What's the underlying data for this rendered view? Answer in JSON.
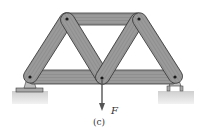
{
  "figure": {
    "force_label": "F",
    "caption": "(c)"
  },
  "colors": {
    "member_fill": "#8f8f8f",
    "member_stroke": "#3a3a3a",
    "grain": "#b5b5b5",
    "pin": "#1a1a1a",
    "ground": "#e0e0e0",
    "support": "#a9a9a9",
    "arrow": "#555555"
  },
  "diagram": {
    "type": "truss",
    "joints": [
      {
        "id": "top-left",
        "x": 67,
        "y": 19
      },
      {
        "id": "top-right",
        "x": 139,
        "y": 19
      },
      {
        "id": "bottom-left",
        "x": 30,
        "y": 77
      },
      {
        "id": "bottom-middle",
        "x": 102,
        "y": 78
      },
      {
        "id": "bottom-right",
        "x": 175,
        "y": 77
      }
    ],
    "supports": [
      "pin-left",
      "roller-right"
    ],
    "load": {
      "at": "bottom-middle",
      "direction": "down"
    }
  }
}
